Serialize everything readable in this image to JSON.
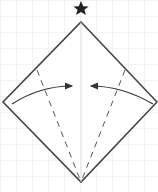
{
  "diagram": {
    "title": "Origami fold step",
    "background_color": "#ffffff",
    "grid_color": "#e6e6e6",
    "line_color": "#444444",
    "fold_color": "#555555",
    "arrow_color": "#333333",
    "star_symbol": "★",
    "shape": "square-diamond",
    "vertices": {
      "top": [
        81,
        22
      ],
      "left": [
        3,
        102
      ],
      "right": [
        157,
        102
      ],
      "bottom": [
        81,
        182
      ]
    },
    "center_crease": "vertical",
    "valley_folds": [
      {
        "from": [
          37,
          70
        ],
        "to": [
          81,
          182
        ]
      },
      {
        "from": [
          125,
          70
        ],
        "to": [
          81,
          182
        ]
      }
    ],
    "arrows": [
      {
        "direction": "left-to-center",
        "start": [
          12,
          104
        ],
        "end": [
          74,
          86
        ]
      },
      {
        "direction": "right-to-center",
        "start": [
          153,
          104
        ],
        "end": [
          89,
          86
        ]
      }
    ],
    "marker": "star at top vertex"
  }
}
